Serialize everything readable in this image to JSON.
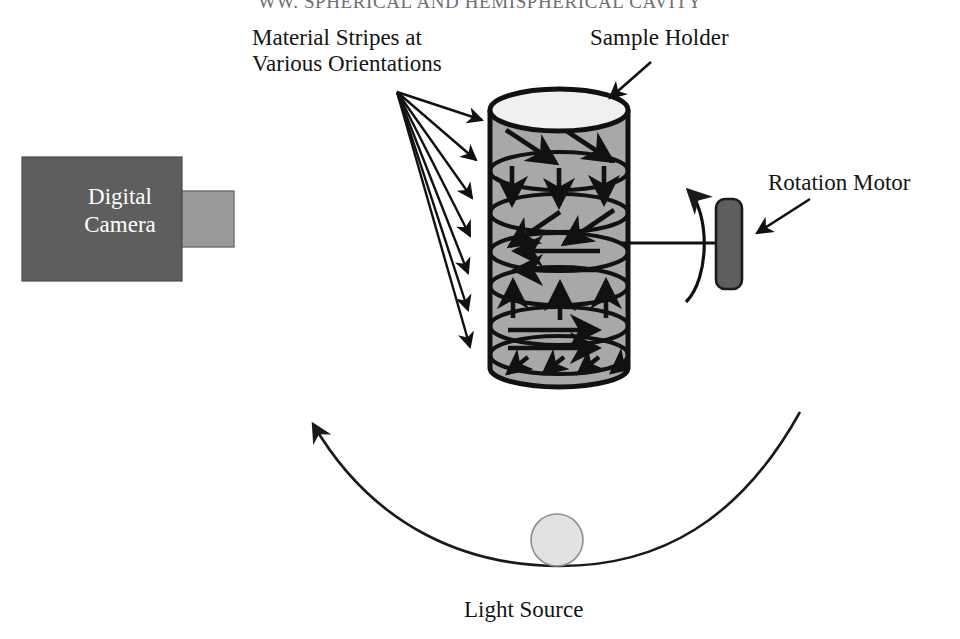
{
  "figure": {
    "running_head": "WW. SPHERICAL AND HEMISPHERICAL CAVITY",
    "labels": {
      "material_stripes_line1": "Material Stripes at",
      "material_stripes_line2": "Various Orientations",
      "sample_holder": "Sample Holder",
      "rotation_motor": "Rotation Motor",
      "light_source": "Light Source",
      "camera_line1": "Digital",
      "camera_line2": "Camera"
    },
    "colors": {
      "stroke": "#111111",
      "cylinder_body": "#a8a8a8",
      "cylinder_top": "#f0f0f0",
      "camera_body": "#5e5e5e",
      "camera_lens": "#9a9a9a",
      "motor_body": "#5e5e5e",
      "light_source_fill": "#e2e2e2",
      "arc_stroke": "#1a1a1a",
      "background": "#ffffff"
    },
    "components": [
      {
        "name": "digital-camera",
        "kind": "rectangle",
        "label": "Digital Camera"
      },
      {
        "name": "camera-lens",
        "kind": "rectangle",
        "label": ""
      },
      {
        "name": "sample-holder-cylinder",
        "kind": "cylinder",
        "label": "Sample Holder"
      },
      {
        "name": "rotation-motor",
        "kind": "rounded-rectangle",
        "label": "Rotation Motor"
      },
      {
        "name": "motor-shaft",
        "kind": "line",
        "label": ""
      },
      {
        "name": "rotation-direction-arrow",
        "kind": "curved-arrow",
        "label": ""
      },
      {
        "name": "light-source",
        "kind": "circle",
        "label": "Light Source"
      },
      {
        "name": "light-source-travel-arc",
        "kind": "arc-arrow",
        "label": ""
      }
    ],
    "stripe_bands": [
      {
        "index": 1,
        "orientation": "diagonal-down-right",
        "arrow_count": 2
      },
      {
        "index": 2,
        "orientation": "down",
        "arrow_count": 3
      },
      {
        "index": 3,
        "orientation": "diagonal-down-left",
        "arrow_count": 2
      },
      {
        "index": 4,
        "orientation": "left",
        "arrow_count": 2
      },
      {
        "index": 5,
        "orientation": "up",
        "arrow_count": 3
      },
      {
        "index": 6,
        "orientation": "right",
        "arrow_count": 2
      },
      {
        "index": 7,
        "orientation": "diagonal-down-left-small",
        "arrow_count": 4
      }
    ],
    "leader_arrow_count": 7
  }
}
